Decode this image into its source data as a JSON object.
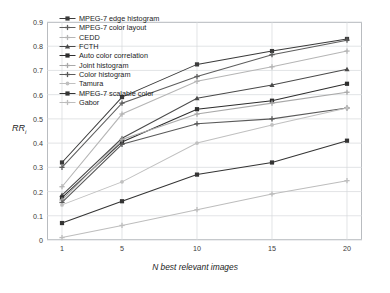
{
  "chart_data": {
    "type": "line",
    "title": "",
    "xlabel": "N best relevant images",
    "ylabel": "RR",
    "ylabel_sub": "i",
    "x": [
      1,
      5,
      10,
      15,
      20
    ],
    "xticks": [
      "1",
      "5",
      "10",
      "15",
      "20"
    ],
    "yticks": [
      "0",
      "0.1",
      "0.2",
      "0.3",
      "0.4",
      "0.5",
      "0.6",
      "0.7",
      "0.8",
      "0.9"
    ],
    "xlim": [
      0,
      21
    ],
    "ylim": [
      0,
      0.9
    ],
    "grid": true,
    "legend_position": "top-left",
    "series": [
      {
        "name": "MPEG-7 edge histogram",
        "color": "#3b3b3b",
        "marker": "square",
        "values": [
          0.32,
          0.59,
          0.725,
          0.78,
          0.83
        ]
      },
      {
        "name": "MPEG-7 color layout",
        "color": "#5e5e5e",
        "marker": "plus",
        "values": [
          0.3,
          0.565,
          0.675,
          0.765,
          0.825
        ]
      },
      {
        "name": "CEDD",
        "color": "#b5b5b5",
        "marker": "plus",
        "values": [
          0.22,
          0.52,
          0.655,
          0.715,
          0.78
        ]
      },
      {
        "name": "FCTH",
        "color": "#4a4a4a",
        "marker": "triangle",
        "values": [
          0.185,
          0.42,
          0.585,
          0.64,
          0.705
        ]
      },
      {
        "name": "Auto color correlation",
        "color": "#2e2e2e",
        "marker": "square",
        "values": [
          0.175,
          0.405,
          0.54,
          0.575,
          0.645
        ]
      },
      {
        "name": "Joint histogram",
        "color": "#a9a9a9",
        "marker": "plus",
        "values": [
          0.165,
          0.415,
          0.52,
          0.565,
          0.61
        ]
      },
      {
        "name": "Color histogram",
        "color": "#5a5a5a",
        "marker": "plus",
        "values": [
          0.155,
          0.395,
          0.48,
          0.5,
          0.545
        ]
      },
      {
        "name": "Tamura",
        "color": "#c0c0c0",
        "marker": "circle",
        "values": [
          0.145,
          0.24,
          0.4,
          0.475,
          0.545
        ]
      },
      {
        "name": "MPEG-7 scalable color",
        "color": "#343434",
        "marker": "square",
        "values": [
          0.07,
          0.16,
          0.27,
          0.32,
          0.41
        ]
      },
      {
        "name": "Gabor",
        "color": "#bdbdbd",
        "marker": "plus",
        "values": [
          0.01,
          0.06,
          0.125,
          0.19,
          0.245
        ]
      }
    ]
  }
}
